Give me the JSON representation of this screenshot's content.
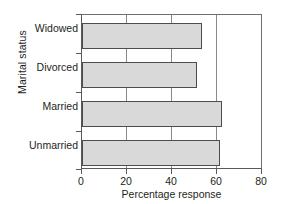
{
  "chart_data": {
    "type": "bar",
    "orientation": "horizontal",
    "title": "",
    "xlabel": "Percentage response",
    "ylabel": "Marital status",
    "categories": [
      "Widowed",
      "Divorced",
      "Married",
      "Unmarried"
    ],
    "values": [
      53,
      51,
      62,
      61
    ],
    "xlim": [
      0,
      80
    ],
    "xticks": [
      0,
      20,
      40,
      60,
      80
    ],
    "xtick_labels": [
      "0",
      "20",
      "40",
      "60",
      "80"
    ],
    "grid": true,
    "legend": null,
    "series": [
      {
        "name": "Percentage response",
        "values": [
          53,
          51,
          62,
          61
        ]
      }
    ],
    "colors": {
      "bar_fill": "#d9d9d9",
      "bar_edge": "#4d4d4d",
      "axis": "#58595b",
      "gridline": "#8a8a8a",
      "text": "#231f20",
      "background": "#ffffff"
    }
  }
}
